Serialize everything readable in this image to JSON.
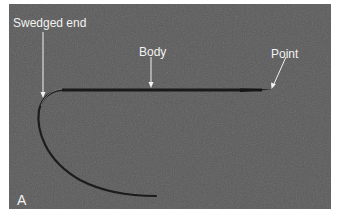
{
  "figure": {
    "panel_letter": "A",
    "background_color": "#5b5b5b",
    "labels": [
      {
        "id": "swedged-end",
        "text": "Swedged end"
      },
      {
        "id": "body",
        "text": "Body"
      },
      {
        "id": "point",
        "text": "Point"
      }
    ]
  }
}
